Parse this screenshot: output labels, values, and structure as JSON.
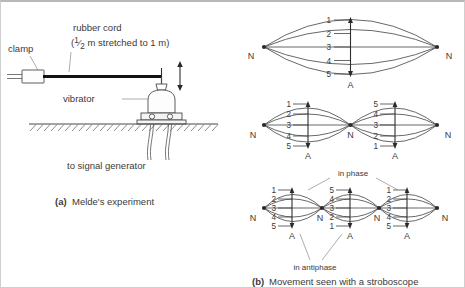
{
  "panel_a": {
    "caption_tag": "(a)",
    "caption_text": "Melde's experiment",
    "labels": {
      "clamp": "clamp",
      "cord_line1": "rubber cord",
      "cord_line2_prefix": "(",
      "cord_fraction_num": "1",
      "cord_fraction_den": "2",
      "cord_line2_suffix": " m stretched to 1 m)",
      "vibrator": "vibrator",
      "signal_generator": "to signal generator"
    }
  },
  "panel_b": {
    "caption_tag": "(b)",
    "caption_text": "Movement seen with a stroboscope",
    "node_label": "N",
    "antinode_label": "A",
    "annotations": {
      "in_phase": "in phase",
      "in_antiphase": "in antiphase"
    },
    "modes": [
      {
        "name": "fundamental",
        "loops": [
          {
            "numbers": [
              "1",
              "2",
              "3",
              "4",
              "5"
            ],
            "antinode": "A"
          }
        ],
        "nodes": [
          "N",
          "N"
        ]
      },
      {
        "name": "second-harmonic",
        "loops": [
          {
            "numbers": [
              "1",
              "2",
              "3",
              "4",
              "5"
            ],
            "antinode": "A"
          },
          {
            "numbers": [
              "5",
              "4",
              "3",
              "2",
              "1"
            ],
            "antinode": "A"
          }
        ],
        "nodes": [
          "N",
          "N",
          "N"
        ]
      },
      {
        "name": "third-harmonic",
        "loops": [
          {
            "numbers": [
              "1",
              "2",
              "3",
              "4",
              "5"
            ],
            "antinode": "A"
          },
          {
            "numbers": [
              "5",
              "4",
              "3",
              "2",
              "1"
            ],
            "antinode": "A"
          },
          {
            "numbers": [
              "1",
              "2",
              "3",
              "4",
              "5"
            ],
            "antinode": "A"
          }
        ],
        "nodes": [
          "N",
          "N",
          "N",
          "N"
        ]
      }
    ]
  },
  "colors": {
    "ink": "#3a3a3a",
    "cord": "#111111",
    "curve": "#4d4d4d",
    "frame": "#cfcfcf"
  }
}
